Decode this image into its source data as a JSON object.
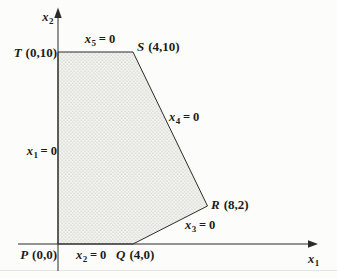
{
  "colors": {
    "background": "#fcfcfa",
    "line": "#2b2b28",
    "text": "#1c1c1a",
    "fill_base": "#f3f3f0",
    "fill_dot": "#b3b3af",
    "faint_line": "#e4e4e0"
  },
  "axis_labels": {
    "horizontal": {
      "var": "x",
      "sub": "1"
    },
    "vertical": {
      "var": "x",
      "sub": "2"
    }
  },
  "vertices": {
    "P": {
      "letter": "P",
      "coords": "(0,0)",
      "x": 0,
      "y": 0
    },
    "Q": {
      "letter": "Q",
      "coords": "(4,0)",
      "x": 4,
      "y": 0
    },
    "R": {
      "letter": "R",
      "coords": "(8,2)",
      "x": 8,
      "y": 2
    },
    "S": {
      "letter": "S",
      "coords": "(4,10)",
      "x": 4,
      "y": 10
    },
    "T": {
      "letter": "T",
      "coords": "(0,10)",
      "x": 0,
      "y": 10
    }
  },
  "edge_labels": {
    "x1": {
      "var": "x",
      "sub": "1",
      "rest": " = 0"
    },
    "x2": {
      "var": "x",
      "sub": "2",
      "rest": " = 0"
    },
    "x3": {
      "var": "x",
      "sub": "3",
      "rest": " = 0"
    },
    "x4": {
      "var": "x",
      "sub": "4",
      "rest": " = 0"
    },
    "x5": {
      "var": "x",
      "sub": "5",
      "rest": " = 0"
    }
  }
}
